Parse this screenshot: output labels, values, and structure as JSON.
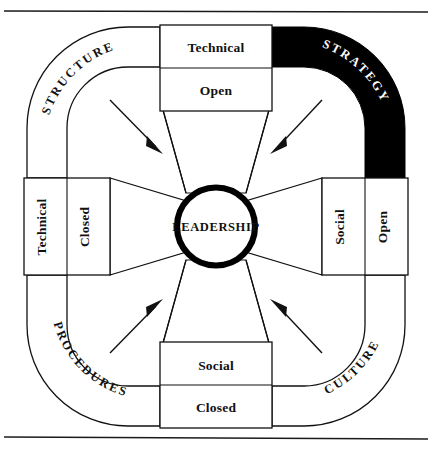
{
  "diagram": {
    "core": {
      "label": "LEADERSHIP"
    },
    "bands": [
      {
        "id": "structure",
        "label": "STRUCTURE",
        "position": "top-left",
        "fill": "#ffffff",
        "text_color": "#111111"
      },
      {
        "id": "strategy",
        "label": "STRATEGY",
        "position": "top-right",
        "fill": "#000000",
        "text_color": "#ffffff"
      },
      {
        "id": "procedures",
        "label": "PROCEDURES",
        "position": "bottom-left",
        "fill": "#ffffff",
        "text_color": "#111111"
      },
      {
        "id": "culture",
        "label": "CULTURE",
        "position": "bottom-right",
        "fill": "#ffffff",
        "text_color": "#111111"
      }
    ],
    "boxes": [
      {
        "id": "top",
        "position": "top",
        "orientation": "horizontal",
        "upper": "Technical",
        "lower": "Open"
      },
      {
        "id": "right",
        "position": "right",
        "orientation": "vertical",
        "upper": "Social",
        "lower": "Open"
      },
      {
        "id": "bottom",
        "position": "bottom",
        "orientation": "horizontal",
        "upper": "Social",
        "lower": "Closed"
      },
      {
        "id": "left",
        "position": "left",
        "orientation": "vertical",
        "upper": "Technical",
        "lower": "Closed"
      }
    ],
    "arrows": [
      {
        "id": "arrow-top-left",
        "points_to": "center",
        "from": "structure"
      },
      {
        "id": "arrow-top-right",
        "points_to": "center",
        "from": "strategy"
      },
      {
        "id": "arrow-bottom-left",
        "points_to": "center",
        "from": "procedures"
      },
      {
        "id": "arrow-bottom-right",
        "points_to": "center",
        "from": "culture"
      }
    ],
    "rules": {
      "top_rule": true,
      "bottom_rule": true
    },
    "colors": {
      "ink": "#111111",
      "paper": "#ffffff",
      "highlight": "#000000"
    }
  }
}
